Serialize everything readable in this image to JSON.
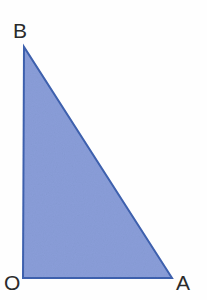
{
  "figure": {
    "type": "right-triangle-diagram",
    "background_color": "#fefefe",
    "fill_color": "#8a9ed9",
    "stroke_color": "#3f62b0",
    "label_color": "#2b2b2b",
    "stroke_width": 2,
    "vertices": [
      {
        "id": "B",
        "label": "B",
        "x": 24,
        "y": 47,
        "label_x": 13,
        "label_y": 20
      },
      {
        "id": "O",
        "label": "O",
        "x": 23,
        "y": 278,
        "label_x": 4,
        "label_y": 272
      },
      {
        "id": "A",
        "label": "A",
        "x": 172,
        "y": 278,
        "label_x": 176,
        "label_y": 272
      }
    ],
    "edges": [
      {
        "id": "OB",
        "from": "O",
        "to": "B",
        "name": "vertical-leg"
      },
      {
        "id": "OA",
        "from": "O",
        "to": "A",
        "name": "horizontal-leg"
      },
      {
        "id": "BA",
        "from": "B",
        "to": "A",
        "name": "hypotenuse"
      }
    ],
    "right_angle_at": "O",
    "points_path": "24,47 23,278 172,278"
  }
}
